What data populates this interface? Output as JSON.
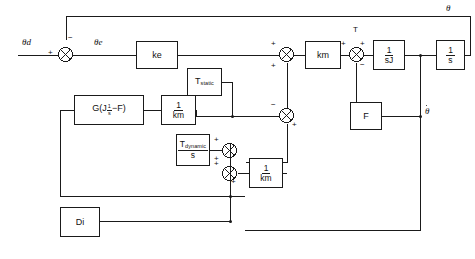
{
  "diagram": {
    "type": "control-block-diagram",
    "background_color": "#ffffff",
    "line_color": "#1a1a1a",
    "signals": {
      "input": "θd",
      "error": "θe",
      "torque": "T",
      "output_position": "θ",
      "output_velocity": "θ"
    },
    "blocks": [
      {
        "id": "ke",
        "label": "ke",
        "kind": "gain"
      },
      {
        "id": "km",
        "label": "km",
        "kind": "gain"
      },
      {
        "id": "inv-sJ",
        "num": "1",
        "den": "sJ",
        "kind": "fraction"
      },
      {
        "id": "inv-s",
        "num": "1",
        "den": "s",
        "kind": "fraction"
      },
      {
        "id": "F",
        "label": "F",
        "kind": "gain"
      },
      {
        "id": "t-static",
        "label": "T",
        "sub": "static",
        "kind": "subscripted"
      },
      {
        "id": "t-dynamic",
        "num": "T",
        "num_sub": "dynamic",
        "den": "s",
        "kind": "fraction-sub"
      },
      {
        "id": "g-js-f",
        "label": "G(J",
        "exp_num": "1",
        "exp_den": "s",
        "label_tail": "−F)",
        "kind": "expression"
      },
      {
        "id": "inv-km-1",
        "num": "1",
        "den": "km",
        "kind": "fraction"
      },
      {
        "id": "inv-km-2",
        "num": "1",
        "den": "km",
        "kind": "fraction"
      },
      {
        "id": "Di",
        "label": "Di",
        "kind": "source"
      }
    ],
    "summers": [
      {
        "id": "sum-error",
        "signs": {
          "left": "+",
          "top": "−"
        }
      },
      {
        "id": "sum-drive",
        "signs": {
          "left": "+",
          "bottom": "+"
        }
      },
      {
        "id": "sum-torque",
        "signs": {
          "left": "+",
          "top": "+",
          "bottom": "−"
        },
        "label": "T"
      },
      {
        "id": "sum-friction",
        "signs": {
          "left": "−",
          "bottom": "+"
        }
      },
      {
        "id": "sum-dyn",
        "signs": {
          "top": "+",
          "bottom": "+"
        }
      },
      {
        "id": "sum-dist",
        "signs": {
          "top": "+",
          "bottom": "+"
        }
      }
    ]
  }
}
